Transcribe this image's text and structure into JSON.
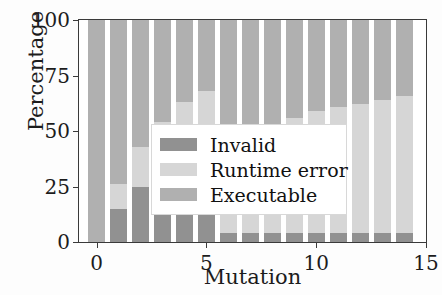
{
  "chart_data": {
    "type": "bar",
    "stacked": true,
    "title": "",
    "xlabel": "Mutation",
    "ylabel": "Percentage",
    "categories": [
      0,
      1,
      2,
      3,
      4,
      5,
      6,
      7,
      8,
      9,
      10,
      11,
      12,
      13,
      14
    ],
    "xlim": [
      -0.8,
      15
    ],
    "ylim": [
      0,
      100
    ],
    "xticks": [
      "0",
      "5",
      "10",
      "15"
    ],
    "xtick_values": [
      0,
      5,
      10,
      15
    ],
    "yticks": [
      "0",
      "25",
      "50",
      "75",
      "100"
    ],
    "ytick_values": [
      0,
      25,
      50,
      75,
      100
    ],
    "grid": false,
    "legend_position": "center-right",
    "series": [
      {
        "name": "Invalid",
        "color": "#919191",
        "values": [
          0,
          15,
          25,
          34,
          41,
          48,
          4,
          4,
          4,
          4,
          4,
          4,
          4,
          4,
          4
        ]
      },
      {
        "name": "Runtime error",
        "color": "#d6d6d6",
        "values": [
          0,
          11,
          18,
          20,
          22,
          20,
          36,
          42,
          48,
          52,
          55,
          57,
          58,
          60,
          62
        ]
      },
      {
        "name": "Executable",
        "color": "#b0b0b0",
        "values": [
          100,
          74,
          57,
          46,
          37,
          32,
          60,
          54,
          48,
          44,
          41,
          39,
          38,
          36,
          34
        ]
      }
    ],
    "bar_tops": {
      "invalid_top": [
        0,
        15,
        25,
        34,
        41,
        48,
        4,
        4,
        4,
        4,
        4,
        4,
        4,
        4,
        4
      ],
      "runtime_top": [
        0,
        26,
        43,
        54,
        63,
        68,
        40,
        46,
        52,
        56,
        59,
        61,
        62,
        64,
        66
      ],
      "executable_top": [
        100,
        100,
        100,
        100,
        100,
        100,
        100,
        100,
        100,
        100,
        100,
        100,
        100,
        100,
        100
      ]
    }
  },
  "legend": {
    "items": [
      {
        "label": "Invalid",
        "color": "#919191"
      },
      {
        "label": "Runtime error",
        "color": "#d6d6d6"
      },
      {
        "label": "Executable",
        "color": "#b0b0b0"
      }
    ]
  },
  "axes": {
    "y_title": "Percentage",
    "x_title": "Mutation"
  }
}
